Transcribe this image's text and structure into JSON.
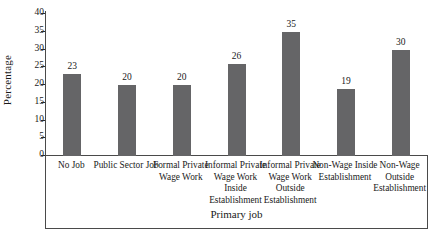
{
  "chart_data": {
    "type": "bar",
    "title": "",
    "xlabel": "Primary job",
    "ylabel": "Percentage",
    "categories": [
      "No Job",
      "Public Sector Job",
      "Formal Private Wage Work",
      "Informal Private Wage Work Inside Establishment",
      "Informal Private Wage Work Outside Establishment",
      "Non-Wage Inside Establishment",
      "Non-Wage Outside Establishment"
    ],
    "values": [
      23,
      20,
      20,
      26,
      35,
      19,
      30
    ],
    "data_labels": [
      "23",
      "20",
      "20",
      "26",
      "35",
      "19",
      "30"
    ],
    "ylim": [
      0,
      40
    ],
    "ytick_labels": [
      "40",
      "35",
      "30",
      "25",
      "20",
      "15",
      "10",
      "5",
      "0"
    ],
    "ytick_values": [
      40,
      35,
      30,
      25,
      20,
      15,
      10,
      5,
      0
    ],
    "grid": false,
    "legend": "none",
    "bar_color": "#656567",
    "axis_color": "#4a4a4a"
  }
}
